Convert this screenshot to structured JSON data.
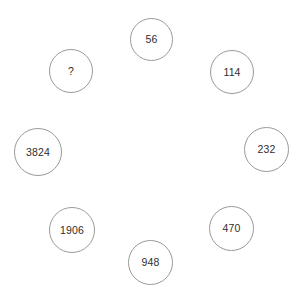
{
  "diagram": {
    "title": "",
    "type": "circular-number-sequence-puzzle",
    "style": {
      "background": "#ffffff",
      "circle_stroke": "#9a9a9a",
      "circle_fill": "#ffffff",
      "text_color": "#2e2e2e"
    },
    "nodes": [
      {
        "id": "node-56",
        "label": "56",
        "position": "top",
        "x": 130,
        "y": 18,
        "size": 43
      },
      {
        "id": "node-114",
        "label": "114",
        "position": "top-right",
        "x": 210,
        "y": 50,
        "size": 44
      },
      {
        "id": "node-232",
        "label": "232",
        "position": "right",
        "x": 244,
        "y": 127,
        "size": 45
      },
      {
        "id": "node-470",
        "label": "470",
        "position": "bottom-right",
        "x": 209,
        "y": 206,
        "size": 45
      },
      {
        "id": "node-948",
        "label": "948",
        "position": "bottom",
        "x": 128,
        "y": 240,
        "size": 45
      },
      {
        "id": "node-1906",
        "label": "1906",
        "position": "bottom-left",
        "x": 49,
        "y": 207,
        "size": 46
      },
      {
        "id": "node-3824",
        "label": "3824",
        "position": "left",
        "x": 14,
        "y": 128,
        "size": 48
      },
      {
        "id": "node-unknown",
        "label": "?",
        "position": "top-left",
        "x": 49,
        "y": 49,
        "size": 44
      }
    ]
  },
  "chart_data": {
    "type": "diagram",
    "title": "",
    "categories": [
      "top",
      "top-right",
      "right",
      "bottom-right",
      "bottom",
      "bottom-left",
      "left",
      "top-left"
    ],
    "values": [
      56,
      114,
      232,
      470,
      948,
      1906,
      3824,
      null
    ],
    "labels": [
      "56",
      "114",
      "232",
      "470",
      "948",
      "1906",
      "3824",
      "?"
    ],
    "unknown_index": 7,
    "arrangement": "ring",
    "legend": []
  }
}
